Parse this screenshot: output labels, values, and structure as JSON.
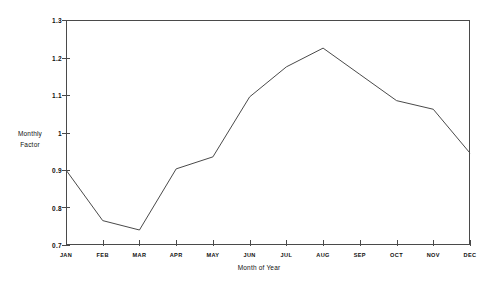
{
  "chart_data": {
    "type": "line",
    "title": "",
    "xlabel": "Month of Year",
    "ylabel": "Monthly Factor",
    "ylabel_lines": [
      "Monthly",
      "Factor"
    ],
    "categories": [
      "JAN",
      "FEB",
      "MAR",
      "APR",
      "MAY",
      "JUN",
      "JUL",
      "AUG",
      "SEP",
      "OCT",
      "NOV",
      "DEC"
    ],
    "values": [
      0.9,
      0.765,
      0.74,
      0.903,
      0.935,
      1.095,
      1.175,
      1.225,
      1.155,
      1.085,
      1.062,
      0.945
    ],
    "series": [
      {
        "name": "Monthly Factor",
        "values": [
          0.9,
          0.765,
          0.74,
          0.903,
          0.935,
          1.095,
          1.175,
          1.225,
          1.155,
          1.085,
          1.062,
          0.945
        ]
      }
    ],
    "ylim": [
      0.7,
      1.3
    ],
    "ytick_labels": [
      "0.7",
      "0.8",
      "0.9",
      "1",
      "1.1",
      "1.2",
      "1.3"
    ],
    "ytick_values": [
      0.7,
      0.8,
      0.9,
      1.0,
      1.1,
      1.2,
      1.3
    ],
    "grid": false,
    "legend": false,
    "legend_position": "none",
    "line_color": "#4a4a4a",
    "axis_color": "#4a4a4a",
    "background_color": "#ffffff",
    "marker": "none"
  }
}
